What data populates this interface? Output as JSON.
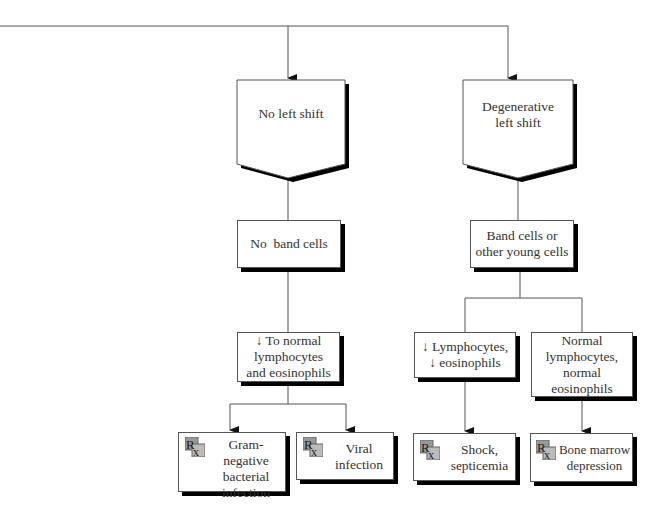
{
  "diagram": {
    "type": "flowchart",
    "nodes": {
      "no_left_shift": {
        "label": "No left shift"
      },
      "degenerative_left_shift": {
        "label_line1": "Degenerative",
        "label_line2": "left shift"
      },
      "no_band_cells": {
        "label": "No  band cells"
      },
      "band_cells": {
        "label_line1": "Band cells or",
        "label_line2": "other young cells"
      },
      "to_normal": {
        "label_line1": "↓ To normal",
        "label_line2": "lymphocytes",
        "label_line3": "and eosinophils"
      },
      "decreased": {
        "label_line1": "↓ Lymphocytes,",
        "label_line2": "↓ eosinophils"
      },
      "normal": {
        "label_line1": "Normal",
        "label_line2": "lymphocytes,",
        "label_line3": "normal",
        "label_line4": "eosinophils"
      }
    },
    "outcomes": [
      {
        "icon": "rx-icon",
        "lines": [
          "Gram-",
          "negative",
          "bacterial",
          "infection"
        ]
      },
      {
        "icon": "rx-icon",
        "lines": [
          "Viral",
          "infection"
        ]
      },
      {
        "icon": "rx-icon",
        "lines": [
          "Shock,",
          "septicemia"
        ]
      },
      {
        "icon": "rx-icon",
        "lines": [
          "Bone marrow",
          "depression"
        ]
      }
    ],
    "colors": {
      "line": "#555555",
      "shadow": "#000000",
      "box_fill": "#ffffff"
    }
  }
}
